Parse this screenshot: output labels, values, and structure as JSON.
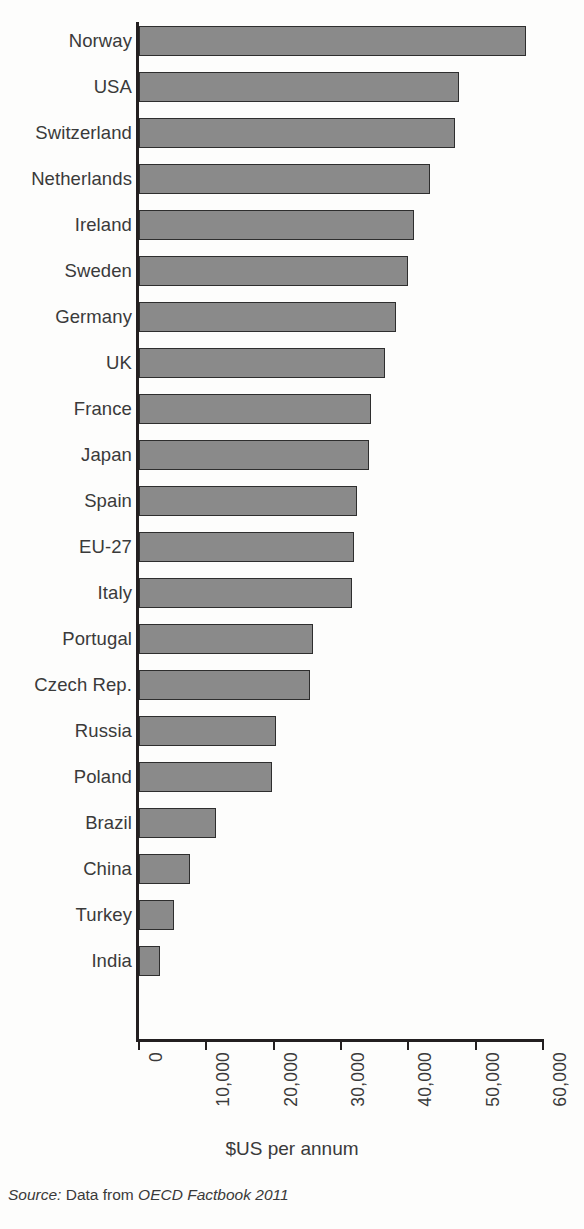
{
  "chart_data": {
    "type": "bar",
    "orientation": "horizontal",
    "title": "",
    "subtitle": "",
    "xlabel": "$US per annum",
    "ylabel": "",
    "xlim": [
      0,
      60000
    ],
    "grid": false,
    "legend": null,
    "bar_color": "#8a8a8a",
    "bar_edge_color": "#2e2e2e",
    "axis_color": "#231f20",
    "xticks": [
      0,
      10000,
      20000,
      30000,
      40000,
      50000,
      60000
    ],
    "xticklabels": [
      "0",
      "10,000",
      "20,000",
      "30,000",
      "40,000",
      "50,000",
      "60,000"
    ],
    "categories": [
      "Norway",
      "USA",
      "Switzerland",
      "Netherlands",
      "Ireland",
      "Sweden",
      "Germany",
      "UK",
      "France",
      "Japan",
      "Spain",
      "EU-27",
      "Italy",
      "Portugal",
      "Czech Rep.",
      "Russia",
      "Poland",
      "Brazil",
      "China",
      "Turkey",
      "India"
    ],
    "values": [
      57500,
      47500,
      47000,
      43200,
      40800,
      40000,
      38200,
      36600,
      34500,
      34200,
      32400,
      32000,
      31600,
      25800,
      25400,
      20300,
      19800,
      11400,
      7500,
      5200,
      3100
    ]
  },
  "footer": {
    "source_lead": "Source:",
    "source_text": "Data from",
    "source_work": "OECD Factbook 2011"
  }
}
